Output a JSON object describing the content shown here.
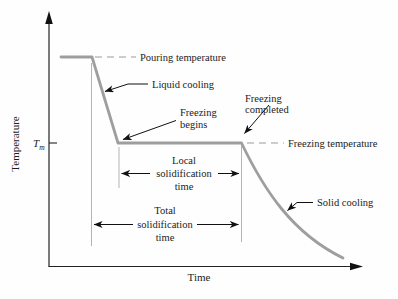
{
  "figure": {
    "type": "annotated-line-diagram",
    "colors": {
      "background": "#fefefe",
      "curve": "#9e9e9e",
      "axis": "#222222",
      "dashed_line": "#999999",
      "reference_line": "#b4b4b4",
      "text": "#1c1c1c"
    },
    "axes": {
      "y_label": "Temperature",
      "x_label": "Time",
      "tm_main": "T",
      "tm_sub": "m"
    },
    "labels": {
      "pouring_temperature": "Pouring temperature",
      "liquid_cooling": "Liquid cooling",
      "freezing_begins": [
        "Freezing",
        "begins"
      ],
      "freezing_completed": [
        "Freezing",
        "completed"
      ],
      "freezing_temperature": "Freezing temperature",
      "solid_cooling": "Solid cooling",
      "local_solidification_time": [
        "Local",
        "solidification",
        "time"
      ],
      "total_solidification_time": [
        "Total",
        "solidification",
        "time"
      ]
    },
    "curve_segments": [
      "constant at pouring temperature",
      "liquid cooling drop to Tm",
      "freezing plateau at Tm (freezing begins to freezing completed)",
      "solid cooling decay"
    ]
  }
}
